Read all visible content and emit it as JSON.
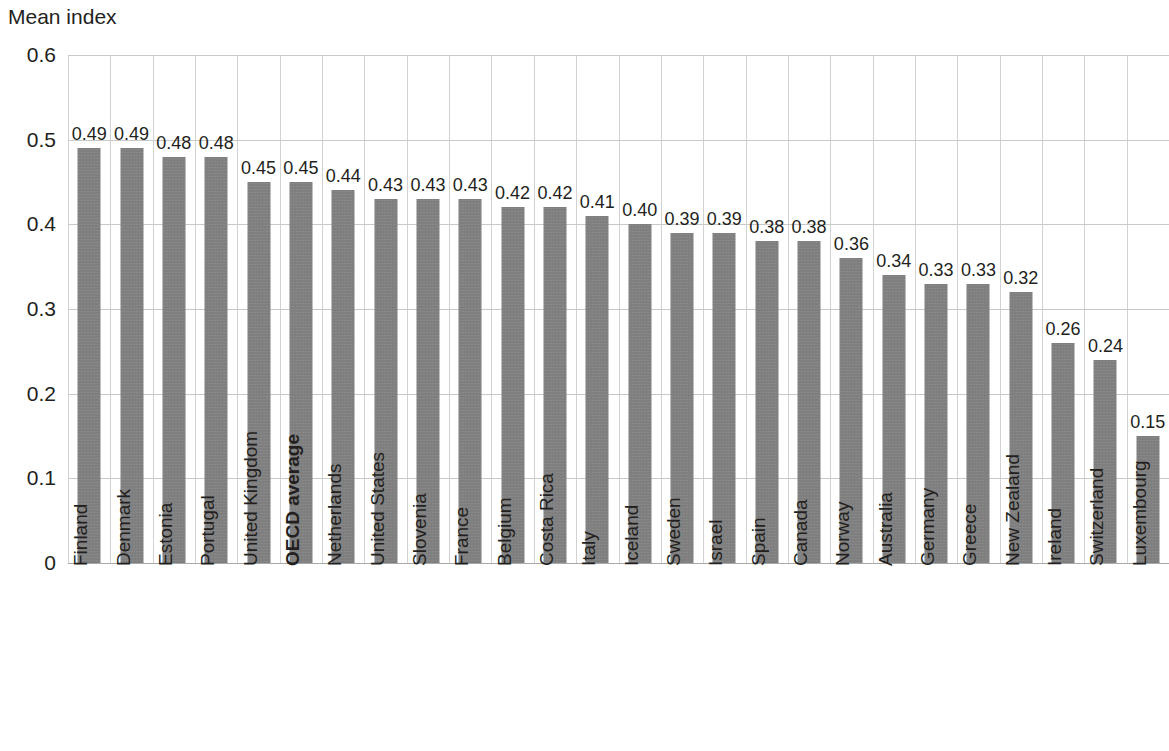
{
  "chart_data": {
    "type": "bar",
    "title": "",
    "subtitle": "",
    "ylabel": "Mean index",
    "xlabel": "",
    "ylim": [
      0,
      0.6
    ],
    "yticks": [
      "0",
      "0.1",
      "0.2",
      "0.3",
      "0.4",
      "0.5",
      "0.6"
    ],
    "ytick_values": [
      0,
      0.1,
      0.2,
      0.3,
      0.4,
      0.5,
      0.6
    ],
    "grid": "horizontal-and-vertical",
    "legend": "none",
    "bar_color": "#7f7f7f",
    "highlight_category": "OECD average",
    "categories": [
      "Finland",
      "Denmark",
      "Estonia",
      "Portugal",
      "United Kingdom",
      "OECD average",
      "Netherlands",
      "United States",
      "Slovenia",
      "France",
      "Belgium",
      "Costa Rica",
      "Italy",
      "Iceland",
      "Sweden",
      "Israel",
      "Spain",
      "Canada",
      "Norway",
      "Australia",
      "Germany",
      "Greece",
      "New Zealand",
      "Ireland",
      "Switzerland",
      "Luxembourg"
    ],
    "values": [
      0.49,
      0.49,
      0.48,
      0.48,
      0.45,
      0.45,
      0.44,
      0.43,
      0.43,
      0.43,
      0.42,
      0.42,
      0.41,
      0.4,
      0.39,
      0.39,
      0.38,
      0.38,
      0.36,
      0.34,
      0.33,
      0.33,
      0.32,
      0.26,
      0.24,
      0.15
    ],
    "value_labels": [
      "0.49",
      "0.49",
      "0.48",
      "0.48",
      "0.45",
      "0.45",
      "0.44",
      "0.43",
      "0.43",
      "0.43",
      "0.42",
      "0.42",
      "0.41",
      "0.40",
      "0.39",
      "0.39",
      "0.38",
      "0.38",
      "0.36",
      "0.34",
      "0.33",
      "0.33",
      "0.32",
      "0.26",
      "0.24",
      "0.15"
    ]
  }
}
